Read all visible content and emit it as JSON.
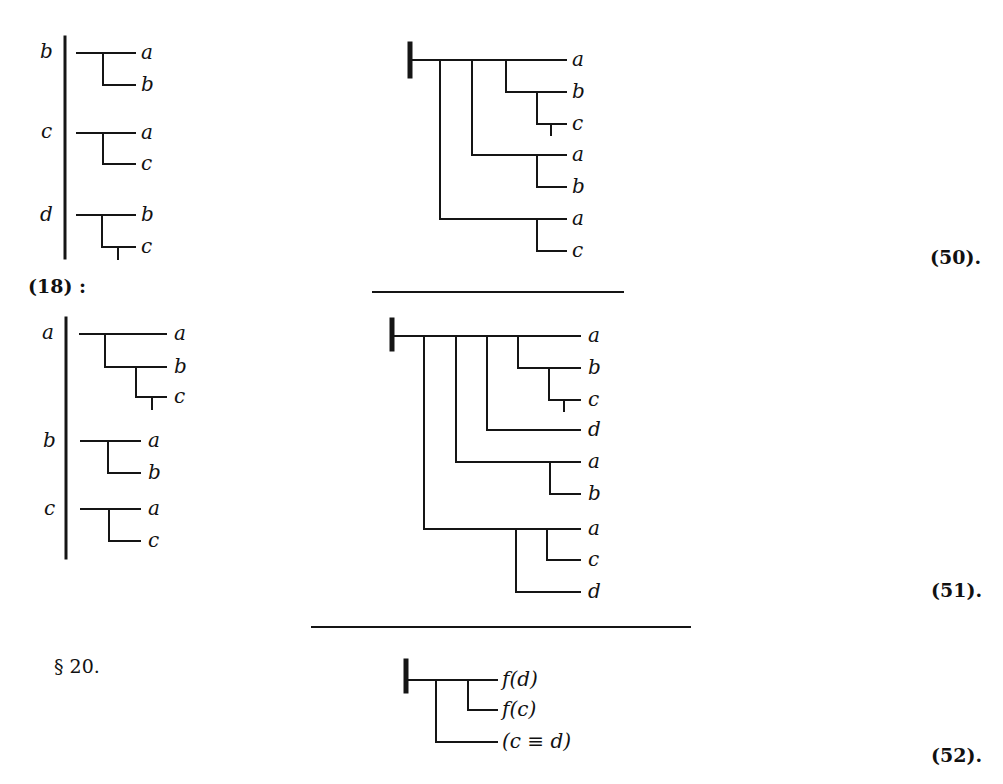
{
  "section": {
    "label": "§ 20."
  },
  "reference": {
    "label": "(18) :"
  },
  "equations": {
    "eq50": "(50).",
    "eq51": "(51).",
    "eq52": "(52)."
  },
  "table1": {
    "rows": [
      {
        "left": "b",
        "top": "a",
        "bottom": "b"
      },
      {
        "left": "c",
        "top": "a",
        "bottom": "c"
      },
      {
        "left": "d",
        "top": "b",
        "bottom": "c"
      }
    ]
  },
  "diagram50": {
    "labels": [
      "a",
      "b",
      "c",
      "a",
      "b",
      "a",
      "c"
    ]
  },
  "table2": {
    "rows": [
      {
        "left": "a",
        "lines": [
          "a",
          "b",
          "c"
        ]
      },
      {
        "left": "b",
        "lines": [
          "a",
          "b"
        ]
      },
      {
        "left": "c",
        "lines": [
          "a",
          "c"
        ]
      }
    ]
  },
  "diagram51": {
    "labels": [
      "a",
      "b",
      "c",
      "d",
      "a",
      "b",
      "a",
      "c",
      "d"
    ]
  },
  "diagram52": {
    "labels": [
      "f(d)",
      "f(c)",
      "(c ≡ d)"
    ]
  },
  "colors": {
    "ink": "#151515",
    "paper": "#ffffff"
  }
}
